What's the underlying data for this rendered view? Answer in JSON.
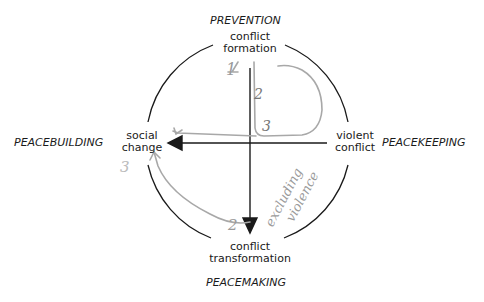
{
  "diagram": {
    "type": "conflict-cycle-circle",
    "colors": {
      "ink": "#1a1a1a",
      "pencil": "#9a9a9a",
      "background": "#ffffff"
    },
    "quadrant_captions": {
      "top": "PREVENTION",
      "right": "PEACEKEEPING",
      "bottom": "PEACEMAKING",
      "left": "PEACEBUILDING"
    },
    "axis_labels": {
      "top": [
        "conflict",
        "formation"
      ],
      "right": [
        "violent",
        "conflict"
      ],
      "bottom": [
        "conflict",
        "transformation"
      ],
      "left": [
        "social",
        "change"
      ]
    },
    "handwritten": {
      "steps": [
        "1",
        "2",
        "3",
        "3",
        "2"
      ],
      "annotation": [
        "excluding",
        "violence"
      ]
    }
  }
}
